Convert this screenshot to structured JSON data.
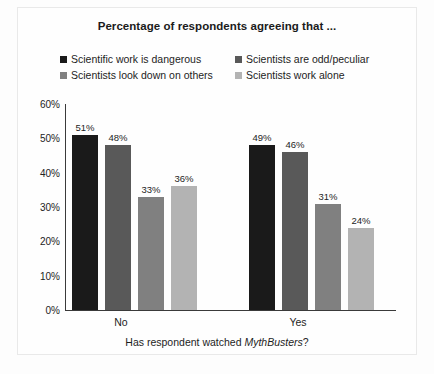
{
  "chart_data": {
    "type": "bar",
    "title": "Percentage of respondents agreeing that ...",
    "xlabel_prefix": "Has respondent watched ",
    "xlabel_italic": "MythBusters",
    "xlabel_suffix": "?",
    "ylabel": "",
    "categories": [
      "No",
      "Yes"
    ],
    "series": [
      {
        "name": "Scientific work is dangerous",
        "values": [
          51,
          48
        ],
        "color": "#1a1a1a",
        "labels": [
          "51%",
          "49%"
        ]
      },
      {
        "name": "Scientists are odd/peculiar",
        "values": [
          48,
          46
        ],
        "color": "#595959",
        "labels": [
          "48%",
          "46%"
        ]
      },
      {
        "name": "Scientists look down on others",
        "values": [
          33,
          31
        ],
        "color": "#808080",
        "labels": [
          "33%",
          "31%"
        ]
      },
      {
        "name": "Scientists work alone",
        "values": [
          36,
          24
        ],
        "color": "#b3b3b3",
        "labels": [
          "36%",
          "24%"
        ]
      }
    ],
    "ylim": [
      0,
      60
    ],
    "ytick_values": [
      0,
      10,
      20,
      30,
      40,
      50,
      60
    ],
    "ytick_labels": [
      "0%",
      "10%",
      "20%",
      "30%",
      "40%",
      "50%",
      "60%"
    ],
    "grid": false,
    "legend_position": "top",
    "value_labels_shown": true
  },
  "series_order_note": {
    "no_values": [
      51,
      48,
      33,
      36
    ],
    "yes_values": [
      49,
      46,
      31,
      24
    ]
  }
}
